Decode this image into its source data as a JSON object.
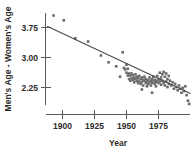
{
  "chart_data": {
    "type": "scatter",
    "title": "",
    "xlabel": "Year",
    "ylabel": "Men's Age - Women's Age",
    "xlim": [
      1888,
      2002
    ],
    "ylim": [
      1.75,
      4.15
    ],
    "grid": false,
    "legend": "none",
    "xticks": [
      1900,
      1925,
      1950,
      1975
    ],
    "xtick_labels": [
      "1900",
      "1925",
      "1950",
      "1975"
    ],
    "yticks": [
      2.25,
      3.0,
      3.75
    ],
    "ytick_labels": [
      "2.25",
      "3.00",
      "3.75"
    ],
    "series": [
      {
        "name": "Age difference at first marriage",
        "marker": "square",
        "color": "#6b6b6b",
        "points": [
          [
            1893,
            4.05
          ],
          [
            1901,
            3.93
          ],
          [
            1910,
            3.48
          ],
          [
            1920,
            3.4
          ],
          [
            1930,
            3.05
          ],
          [
            1936,
            2.88
          ],
          [
            1942,
            2.78
          ],
          [
            1947,
            3.13
          ],
          [
            1948,
            2.74
          ],
          [
            1949,
            2.7
          ],
          [
            1950,
            2.82
          ],
          [
            1950,
            2.62
          ],
          [
            1951,
            2.55
          ],
          [
            1951,
            2.72
          ],
          [
            1952,
            2.6
          ],
          [
            1952,
            2.46
          ],
          [
            1953,
            2.55
          ],
          [
            1953,
            2.42
          ],
          [
            1954,
            2.6
          ],
          [
            1954,
            2.48
          ],
          [
            1955,
            2.44
          ],
          [
            1955,
            2.56
          ],
          [
            1956,
            2.5
          ],
          [
            1956,
            2.38
          ],
          [
            1957,
            2.46
          ],
          [
            1957,
            2.58
          ],
          [
            1958,
            2.42
          ],
          [
            1958,
            2.52
          ],
          [
            1959,
            2.36
          ],
          [
            1959,
            2.48
          ],
          [
            1960,
            2.54
          ],
          [
            1960,
            2.4
          ],
          [
            1961,
            2.46
          ],
          [
            1961,
            2.34
          ],
          [
            1962,
            2.5
          ],
          [
            1962,
            2.38
          ],
          [
            1963,
            2.44
          ],
          [
            1963,
            2.3
          ],
          [
            1964,
            2.42
          ],
          [
            1964,
            2.52
          ],
          [
            1965,
            2.36
          ],
          [
            1965,
            2.46
          ],
          [
            1966,
            2.4
          ],
          [
            1966,
            2.28
          ],
          [
            1967,
            2.44
          ],
          [
            1967,
            2.34
          ],
          [
            1968,
            2.38
          ],
          [
            1968,
            2.5
          ],
          [
            1969,
            2.42
          ],
          [
            1969,
            2.3
          ],
          [
            1970,
            2.36
          ],
          [
            1970,
            2.46
          ],
          [
            1971,
            2.4
          ],
          [
            1971,
            2.52
          ],
          [
            1972,
            2.34
          ],
          [
            1972,
            2.44
          ],
          [
            1973,
            2.38
          ],
          [
            1973,
            2.28
          ],
          [
            1974,
            2.42
          ],
          [
            1974,
            2.54
          ],
          [
            1975,
            2.36
          ],
          [
            1975,
            2.46
          ],
          [
            1976,
            2.62
          ],
          [
            1976,
            2.4
          ],
          [
            1977,
            2.5
          ],
          [
            1977,
            2.32
          ],
          [
            1978,
            2.58
          ],
          [
            1978,
            2.42
          ],
          [
            1979,
            2.64
          ],
          [
            1979,
            2.36
          ],
          [
            1980,
            2.52
          ],
          [
            1980,
            2.3
          ],
          [
            1981,
            2.6
          ],
          [
            1981,
            2.4
          ],
          [
            1982,
            2.46
          ],
          [
            1982,
            2.26
          ],
          [
            1983,
            2.54
          ],
          [
            1983,
            2.34
          ],
          [
            1984,
            2.42
          ],
          [
            1985,
            2.3
          ],
          [
            1986,
            2.38
          ],
          [
            1987,
            2.22
          ],
          [
            1988,
            2.34
          ],
          [
            1989,
            2.26
          ],
          [
            1990,
            2.18
          ],
          [
            1991,
            2.3
          ],
          [
            1992,
            2.22
          ],
          [
            1993,
            2.12
          ],
          [
            1994,
            2.24
          ],
          [
            1995,
            2.16
          ],
          [
            1996,
            2.28
          ],
          [
            1997,
            2.06
          ],
          [
            1970,
            2.12
          ],
          [
            1998,
            1.92
          ],
          [
            1999,
            1.84
          ],
          [
            1945,
            2.52
          ],
          [
            1962,
            2.2
          ]
        ]
      }
    ],
    "trend_line": {
      "name": "least-squares fit",
      "color": "#4a4a4a",
      "start": [
        1888,
        3.78
      ],
      "end": [
        2000,
        2.1
      ]
    }
  }
}
